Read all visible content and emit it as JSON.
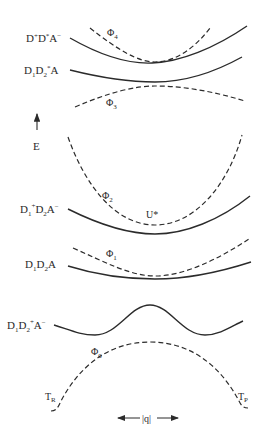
{
  "figure": {
    "axis": {
      "energy_label": "E",
      "coordinate_label": "|q|"
    },
    "states": [
      {
        "id": "d_plus_d_star_a_minus",
        "label": "D",
        "sup1": "+",
        "mid": "D",
        "sup2": "*",
        "tail": "A",
        "sup3": "−",
        "style": "solid"
      },
      {
        "id": "d1_d2_star_a",
        "label": "D",
        "sub1": "1",
        "mid": "D",
        "sub2": "2",
        "sup2": "*",
        "tail": "A",
        "style": "solid"
      },
      {
        "id": "d1_plus_d2_a_minus",
        "label": "D",
        "sub1": "1",
        "sup1": "+",
        "mid": "D",
        "sub2": "2",
        "tail": "A",
        "sup3": "−",
        "style": "solid"
      },
      {
        "id": "d1_d2_a",
        "label": "D",
        "sub1": "1",
        "mid": "D",
        "sub2": "2",
        "tail": "A",
        "style": "solid"
      },
      {
        "id": "d1_d2_plus_a_minus",
        "label": "D",
        "sub1": "1",
        "mid": "D",
        "sub2": "2",
        "sup2": "+",
        "tail": "A",
        "sup3": "−",
        "style": "solid"
      }
    ],
    "adiabatic_states": [
      {
        "id": "phi4",
        "symbol": "Φ",
        "sub": "4",
        "style": "dashed"
      },
      {
        "id": "phi3",
        "symbol": "Φ",
        "sub": "3",
        "style": "dashed"
      },
      {
        "id": "phi2",
        "symbol": "Φ",
        "sub": "2",
        "style": "dashed"
      },
      {
        "id": "phi1",
        "symbol": "Φ",
        "sub": "1",
        "style": "dashed"
      },
      {
        "id": "phi0",
        "symbol": "Φ",
        "sub": "0",
        "style": "dashed"
      }
    ],
    "point_labels": {
      "u_star": "U*",
      "t_r": {
        "main": "T",
        "sub": "R"
      },
      "t_p": {
        "main": "T",
        "sub": "P"
      }
    }
  }
}
